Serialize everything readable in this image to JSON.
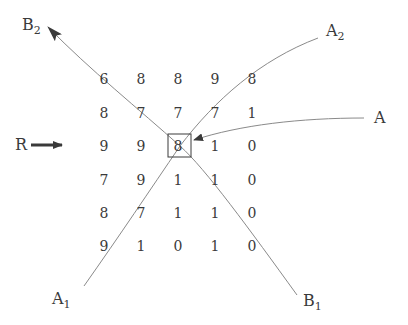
{
  "diagram": {
    "grid": {
      "rows": [
        [
          "6",
          "8",
          "8",
          "9",
          "8"
        ],
        [
          "8",
          "7",
          "7",
          "7",
          "1"
        ],
        [
          "9",
          "9",
          "8",
          "1",
          "0"
        ],
        [
          "7",
          "9",
          "1",
          "1",
          "0"
        ],
        [
          "8",
          "7",
          "1",
          "1",
          "0"
        ],
        [
          "9",
          "1",
          "0",
          "1",
          "0"
        ]
      ],
      "col_x": [
        104,
        141,
        178,
        215,
        252
      ],
      "row_y": [
        79,
        113,
        146,
        180,
        213,
        246
      ],
      "highlighted_cell": {
        "row": 2,
        "col": 2,
        "value": "8"
      }
    },
    "labels": {
      "B2": {
        "main": "B",
        "sub": "2"
      },
      "A2": {
        "main": "A",
        "sub": "2"
      },
      "A": {
        "main": "A",
        "sub": ""
      },
      "R": {
        "main": "R",
        "sub": ""
      },
      "A1": {
        "main": "A",
        "sub": "1"
      },
      "B1": {
        "main": "B",
        "sub": "1"
      }
    },
    "colors": {
      "line": "#8a8a8a",
      "text": "#3a3a3a",
      "arrow": "#3a3a3a",
      "background": "#ffffff"
    }
  }
}
